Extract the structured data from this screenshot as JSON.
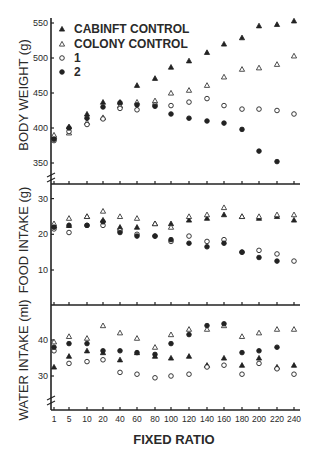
{
  "chart_data": {
    "type": "scatter",
    "xlabel": "FIXED RATIO",
    "x": [
      "1",
      "5",
      "10",
      "20",
      "40",
      "60",
      "80",
      "100",
      "120",
      "140",
      "160",
      "180",
      "200",
      "220",
      "240"
    ],
    "legend": {
      "position": "upper-left (top panel)",
      "entries": [
        {
          "key": "cabinet",
          "label": "CABINFT CONTROL",
          "marker": "filled-triangle"
        },
        {
          "key": "colony",
          "label": "COLONY CONTROL",
          "marker": "open-triangle"
        },
        {
          "key": "g1",
          "label": "1",
          "marker": "open-circle"
        },
        {
          "key": "g2",
          "label": "2",
          "marker": "filled-circle"
        }
      ]
    },
    "panels": [
      {
        "name": "body_weight",
        "ylabel": "BODY WEIGHT (g)",
        "yticks": [
          350,
          400,
          450,
          500,
          550
        ],
        "ylim": [
          335,
          555
        ],
        "axis_break": true,
        "series": [
          {
            "name": "CABINFT CONTROL",
            "values": [
              388,
              402,
              420,
              437,
              437,
              461,
              471,
              487,
              496,
              508,
              520,
              529,
              546,
              548,
              553
            ]
          },
          {
            "name": "COLONY CONTROL",
            "values": [
              390,
              393,
              408,
              415,
              432,
              437,
              439,
              450,
              454,
              461,
              473,
              484,
              486,
              491,
              503
            ]
          },
          {
            "name": "1",
            "values": [
              382,
              395,
              405,
              413,
              428,
              426,
              433,
              432,
              437,
              442,
              432,
              427,
              427,
              425,
              420
            ]
          },
          {
            "name": "2",
            "values": [
              384,
              400,
              414,
              430,
              436,
              433,
              431,
              420,
              414,
              410,
              407,
              398,
              367,
              352,
              null
            ]
          }
        ]
      },
      {
        "name": "food_intake",
        "ylabel": "FOOD INTAKE (g)",
        "yticks": [
          10,
          20,
          30
        ],
        "ylim": [
          0,
          34
        ],
        "axis_break": false,
        "series": [
          {
            "name": "CABINFT CONTROL",
            "values": [
              22.5,
              22.5,
              25,
              24,
              22,
              22,
              23,
              23,
              24,
              24.5,
              25.5,
              25,
              24.5,
              25,
              24
            ]
          },
          {
            "name": "COLONY CONTROL",
            "values": [
              23,
              24.5,
              25,
              26.5,
              25,
              24.5,
              23,
              22,
              25,
              25.5,
              27.5,
              25,
              25,
              25.5,
              25.5
            ]
          },
          {
            "name": "1",
            "values": [
              21.5,
              20.5,
              22.5,
              22.5,
              21,
              20,
              19.5,
              18,
              19.5,
              18,
              18.5,
              15,
              15.5,
              14.5,
              12.5
            ]
          },
          {
            "name": "2",
            "values": [
              22,
              22.5,
              22.5,
              23.5,
              20.5,
              19.5,
              19.5,
              18.5,
              17.5,
              16.5,
              17.5,
              15,
              13.5,
              12.5,
              null
            ]
          }
        ]
      },
      {
        "name": "water_intake",
        "ylabel": "WATER INTAKE (ml)",
        "yticks": [
          30,
          40
        ],
        "ylim": [
          20,
          50
        ],
        "axis_break": true,
        "series": [
          {
            "name": "CABINFT CONTROL",
            "values": [
              32.5,
              35.5,
              37,
              36.5,
              34.5,
              36.5,
              35.5,
              35,
              35.5,
              33,
              35,
              33,
              35,
              32.5,
              33
            ]
          },
          {
            "name": "COLONY CONTROL",
            "values": [
              39.5,
              41,
              40.5,
              44,
              42,
              40.5,
              38,
              41.5,
              43,
              43,
              44,
              41,
              42,
              43,
              43
            ]
          },
          {
            "name": "1",
            "values": [
              37,
              33.5,
              34,
              34.5,
              31,
              30.5,
              29.5,
              30,
              30.5,
              32.5,
              33,
              30.5,
              33.5,
              32,
              30.5
            ]
          },
          {
            "name": "2",
            "values": [
              38,
              39,
              39,
              37,
              37,
              36.5,
              36,
              39,
              41.5,
              44,
              44.5,
              36.5,
              37,
              38,
              null
            ]
          }
        ]
      }
    ],
    "grid": false
  },
  "labels": {
    "xlabel": "FIXED RATIO",
    "legend_cabinet": "CABINFT CONTROL",
    "legend_colony": "COLONY CONTROL",
    "legend_1": "1",
    "legend_2": "2",
    "ylabel_body": "BODY WEIGHT (g)",
    "ylabel_food": "FOOD INTAKE (g)",
    "ylabel_water": "WATER INTAKE (ml)"
  }
}
